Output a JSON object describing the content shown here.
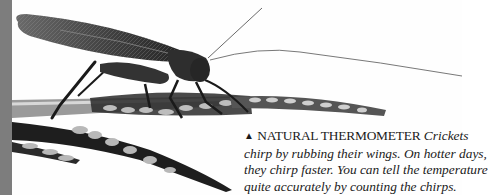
{
  "photo": {
    "subject": "cricket on grass stems",
    "edge_color": "#7d7d7d"
  },
  "caption": {
    "marker": "▲",
    "heading": "NATURAL THERMOMETER",
    "lines": [
      "Crickets",
      "chirp by rubbing their wings. On hotter days,",
      "they chirp faster. You can tell the temperature",
      "quite accurately by counting the chirps."
    ]
  }
}
